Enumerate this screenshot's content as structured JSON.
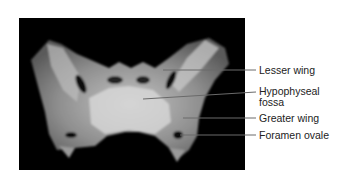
{
  "figure": {
    "background_color": "#000000",
    "bone_color": "#cfcfcf",
    "line_color": "#555555",
    "labels": [
      {
        "text": "Lesser wing",
        "y": 65
      },
      {
        "text": "Hypophyseal",
        "y": 86
      },
      {
        "text": "fossa",
        "y": 97
      },
      {
        "text": "Greater wing",
        "y": 113
      },
      {
        "text": "Foramen ovale",
        "y": 130
      }
    ]
  }
}
